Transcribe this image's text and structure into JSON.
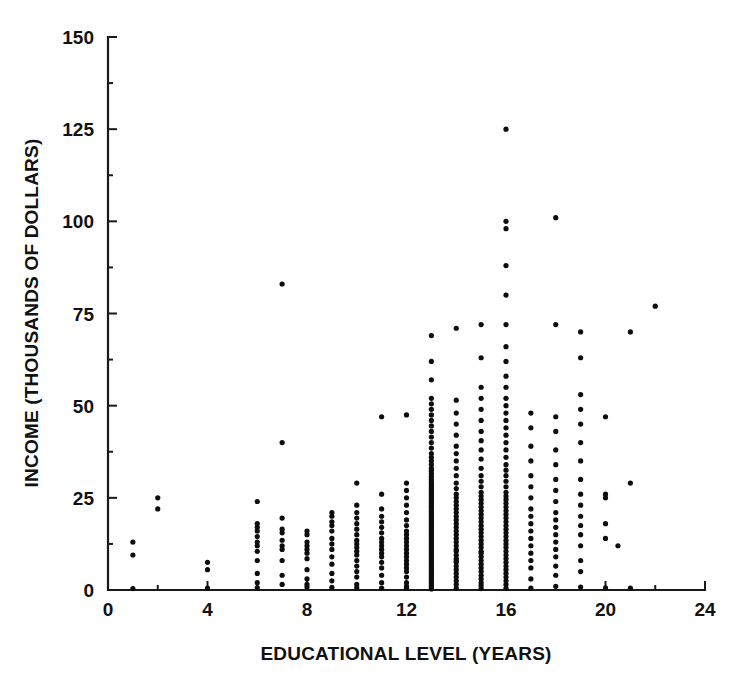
{
  "chart_data": {
    "type": "scatter",
    "title": "",
    "xlabel": "EDUCATIONAL LEVEL (YEARS)",
    "ylabel": "INCOME (THOUSANDS OF DOLLARS)",
    "xlim": [
      0,
      24
    ],
    "ylim": [
      0,
      150
    ],
    "xticks": [
      0,
      4,
      8,
      12,
      16,
      20,
      24
    ],
    "xtick_labels": [
      "0",
      "4",
      "8",
      "12",
      "16",
      "20",
      "24"
    ],
    "yticks": [
      0,
      25,
      50,
      75,
      100,
      125,
      150
    ],
    "ytick_labels": [
      "0",
      "25",
      "50",
      "75",
      "100",
      "125",
      "150"
    ],
    "x_minor_tick_interval": 2,
    "y_minor_tick_interval": 12.5,
    "grid": false,
    "legend": null,
    "marker": "filled-circle",
    "marker_color": "#0d0d0d",
    "marker_size_px": 4,
    "n_points_approx": 430,
    "points": [
      [
        1,
        0.4
      ],
      [
        1,
        9.5
      ],
      [
        1,
        13.0
      ],
      [
        2,
        22.0
      ],
      [
        2,
        25.0
      ],
      [
        4,
        0.5
      ],
      [
        4,
        5.5
      ],
      [
        4,
        7.5
      ],
      [
        6,
        0.6
      ],
      [
        6,
        2.0
      ],
      [
        6,
        4.5
      ],
      [
        6,
        8.0
      ],
      [
        6,
        10.5
      ],
      [
        6,
        12.0
      ],
      [
        6,
        13.0
      ],
      [
        6,
        14.5
      ],
      [
        6,
        16.0
      ],
      [
        6,
        17.0
      ],
      [
        6,
        18.0
      ],
      [
        6,
        24.0
      ],
      [
        7,
        1.5
      ],
      [
        7,
        4.0
      ],
      [
        7,
        8.0
      ],
      [
        7,
        11.0
      ],
      [
        7,
        12.0
      ],
      [
        7,
        13.5
      ],
      [
        7,
        15.5
      ],
      [
        7,
        16.5
      ],
      [
        7,
        19.5
      ],
      [
        7,
        40.0
      ],
      [
        7,
        83.0
      ],
      [
        8,
        0.8
      ],
      [
        8,
        1.5
      ],
      [
        8,
        3.0
      ],
      [
        8,
        5.5
      ],
      [
        8,
        8.5
      ],
      [
        8,
        10.0
      ],
      [
        8,
        11.0
      ],
      [
        8,
        12.0
      ],
      [
        8,
        13.0
      ],
      [
        8,
        15.0
      ],
      [
        8,
        16.0
      ],
      [
        9,
        0.7
      ],
      [
        9,
        2.5
      ],
      [
        9,
        4.5
      ],
      [
        9,
        7.0
      ],
      [
        9,
        9.0
      ],
      [
        9,
        11.0
      ],
      [
        9,
        12.5
      ],
      [
        9,
        14.0
      ],
      [
        9,
        16.0
      ],
      [
        9,
        17.5
      ],
      [
        9,
        18.5
      ],
      [
        9,
        20.0
      ],
      [
        9,
        21.0
      ],
      [
        10,
        0.6
      ],
      [
        10,
        1.5
      ],
      [
        10,
        3.5
      ],
      [
        10,
        5.0
      ],
      [
        10,
        6.5
      ],
      [
        10,
        8.0
      ],
      [
        10,
        9.5
      ],
      [
        10,
        10.5
      ],
      [
        10,
        11.5
      ],
      [
        10,
        12.5
      ],
      [
        10,
        13.5
      ],
      [
        10,
        15.0
      ],
      [
        10,
        16.5
      ],
      [
        10,
        18.0
      ],
      [
        10,
        19.5
      ],
      [
        10,
        21.0
      ],
      [
        10,
        23.0
      ],
      [
        10,
        29.0
      ],
      [
        11,
        0.5
      ],
      [
        11,
        2.0
      ],
      [
        11,
        4.0
      ],
      [
        11,
        6.0
      ],
      [
        11,
        7.5
      ],
      [
        11,
        9.0
      ],
      [
        11,
        10.0
      ],
      [
        11,
        11.0
      ],
      [
        11,
        12.0
      ],
      [
        11,
        13.0
      ],
      [
        11,
        14.0
      ],
      [
        11,
        15.5
      ],
      [
        11,
        17.0
      ],
      [
        11,
        18.5
      ],
      [
        11,
        20.0
      ],
      [
        11,
        22.0
      ],
      [
        11,
        26.0
      ],
      [
        11,
        47.0
      ],
      [
        12,
        0.5
      ],
      [
        12,
        1.0
      ],
      [
        12,
        2.0
      ],
      [
        12,
        3.5
      ],
      [
        12,
        5.0
      ],
      [
        12,
        6.0
      ],
      [
        12,
        7.0
      ],
      [
        12,
        8.0
      ],
      [
        12,
        9.0
      ],
      [
        12,
        10.0
      ],
      [
        12,
        11.0
      ],
      [
        12,
        12.0
      ],
      [
        12,
        13.0
      ],
      [
        12,
        14.0
      ],
      [
        12,
        15.0
      ],
      [
        12,
        16.0
      ],
      [
        12,
        17.5
      ],
      [
        12,
        19.0
      ],
      [
        12,
        21.0
      ],
      [
        12,
        23.0
      ],
      [
        12,
        25.0
      ],
      [
        12,
        27.0
      ],
      [
        12,
        29.0
      ],
      [
        12,
        47.5
      ],
      [
        13,
        0.3
      ],
      [
        13,
        0.8
      ],
      [
        13,
        1.3
      ],
      [
        13,
        1.8
      ],
      [
        13,
        2.3
      ],
      [
        13,
        2.8
      ],
      [
        13,
        3.3
      ],
      [
        13,
        3.8
      ],
      [
        13,
        4.3
      ],
      [
        13,
        4.8
      ],
      [
        13,
        5.3
      ],
      [
        13,
        5.8
      ],
      [
        13,
        6.3
      ],
      [
        13,
        6.8
      ],
      [
        13,
        7.3
      ],
      [
        13,
        7.8
      ],
      [
        13,
        8.3
      ],
      [
        13,
        8.8
      ],
      [
        13,
        9.3
      ],
      [
        13,
        9.8
      ],
      [
        13,
        10.3
      ],
      [
        13,
        10.8
      ],
      [
        13,
        11.3
      ],
      [
        13,
        11.8
      ],
      [
        13,
        12.3
      ],
      [
        13,
        12.8
      ],
      [
        13,
        13.3
      ],
      [
        13,
        13.8
      ],
      [
        13,
        14.3
      ],
      [
        13,
        14.8
      ],
      [
        13,
        15.3
      ],
      [
        13,
        15.8
      ],
      [
        13,
        16.3
      ],
      [
        13,
        16.8
      ],
      [
        13,
        17.3
      ],
      [
        13,
        17.8
      ],
      [
        13,
        18.3
      ],
      [
        13,
        18.8
      ],
      [
        13,
        19.3
      ],
      [
        13,
        19.8
      ],
      [
        13,
        20.3
      ],
      [
        13,
        20.8
      ],
      [
        13,
        21.3
      ],
      [
        13,
        21.8
      ],
      [
        13,
        22.3
      ],
      [
        13,
        22.8
      ],
      [
        13,
        23.3
      ],
      [
        13,
        23.8
      ],
      [
        13,
        24.3
      ],
      [
        13,
        24.8
      ],
      [
        13,
        25.3
      ],
      [
        13,
        25.8
      ],
      [
        13,
        26.3
      ],
      [
        13,
        26.8
      ],
      [
        13,
        27.3
      ],
      [
        13,
        27.8
      ],
      [
        13,
        28.3
      ],
      [
        13,
        28.8
      ],
      [
        13,
        29.3
      ],
      [
        13,
        30.0
      ],
      [
        13,
        30.8
      ],
      [
        13,
        31.5
      ],
      [
        13,
        32.3
      ],
      [
        13,
        33.0
      ],
      [
        13,
        34.0
      ],
      [
        13,
        35.0
      ],
      [
        13,
        36.0
      ],
      [
        13,
        37.0
      ],
      [
        13,
        38.5
      ],
      [
        13,
        40.0
      ],
      [
        13,
        41.5
      ],
      [
        13,
        43.0
      ],
      [
        13,
        44.5
      ],
      [
        13,
        46.0
      ],
      [
        13,
        47.5
      ],
      [
        13,
        49.0
      ],
      [
        13,
        50.5
      ],
      [
        13,
        52.0
      ],
      [
        13,
        57.0
      ],
      [
        13,
        62.0
      ],
      [
        13,
        69.0
      ],
      [
        14,
        0.5
      ],
      [
        14,
        1.5
      ],
      [
        14,
        2.5
      ],
      [
        14,
        3.5
      ],
      [
        14,
        4.5
      ],
      [
        14,
        5.5
      ],
      [
        14,
        6.5
      ],
      [
        14,
        7.5
      ],
      [
        14,
        8.0
      ],
      [
        14,
        8.5
      ],
      [
        14,
        9.5
      ],
      [
        14,
        10.5
      ],
      [
        14,
        11.0
      ],
      [
        14,
        12.0
      ],
      [
        14,
        13.0
      ],
      [
        14,
        14.0
      ],
      [
        14,
        15.0
      ],
      [
        14,
        16.0
      ],
      [
        14,
        17.0
      ],
      [
        14,
        18.0
      ],
      [
        14,
        19.0
      ],
      [
        14,
        20.0
      ],
      [
        14,
        21.0
      ],
      [
        14,
        22.0
      ],
      [
        14,
        23.0
      ],
      [
        14,
        24.0
      ],
      [
        14,
        25.0
      ],
      [
        14,
        26.0
      ],
      [
        14,
        27.5
      ],
      [
        14,
        29.0
      ],
      [
        14,
        31.0
      ],
      [
        14,
        33.0
      ],
      [
        14,
        35.0
      ],
      [
        14,
        37.0
      ],
      [
        14,
        39.0
      ],
      [
        14,
        42.0
      ],
      [
        14,
        45.0
      ],
      [
        14,
        48.0
      ],
      [
        14,
        51.5
      ],
      [
        14,
        71.0
      ],
      [
        15,
        0.4
      ],
      [
        15,
        1.2
      ],
      [
        15,
        2.0
      ],
      [
        15,
        3.0
      ],
      [
        15,
        4.0
      ],
      [
        15,
        5.0
      ],
      [
        15,
        6.0
      ],
      [
        15,
        7.0
      ],
      [
        15,
        8.0
      ],
      [
        15,
        9.0
      ],
      [
        15,
        10.0
      ],
      [
        15,
        10.5
      ],
      [
        15,
        11.5
      ],
      [
        15,
        12.5
      ],
      [
        15,
        13.5
      ],
      [
        15,
        14.5
      ],
      [
        15,
        15.5
      ],
      [
        15,
        16.5
      ],
      [
        15,
        17.5
      ],
      [
        15,
        18.5
      ],
      [
        15,
        19.5
      ],
      [
        15,
        20.5
      ],
      [
        15,
        21.5
      ],
      [
        15,
        22.5
      ],
      [
        15,
        23.5
      ],
      [
        15,
        24.5
      ],
      [
        15,
        25.5
      ],
      [
        15,
        26.5
      ],
      [
        15,
        28.0
      ],
      [
        15,
        29.5
      ],
      [
        15,
        31.0
      ],
      [
        15,
        33.0
      ],
      [
        15,
        35.5
      ],
      [
        15,
        38.0
      ],
      [
        15,
        40.5
      ],
      [
        15,
        43.0
      ],
      [
        15,
        46.0
      ],
      [
        15,
        49.0
      ],
      [
        15,
        52.0
      ],
      [
        15,
        55.0
      ],
      [
        15,
        63.0
      ],
      [
        15,
        72.0
      ],
      [
        16,
        0.5
      ],
      [
        16,
        1.5
      ],
      [
        16,
        2.5
      ],
      [
        16,
        3.5
      ],
      [
        16,
        4.5
      ],
      [
        16,
        5.5
      ],
      [
        16,
        6.5
      ],
      [
        16,
        7.5
      ],
      [
        16,
        8.5
      ],
      [
        16,
        9.5
      ],
      [
        16,
        10.5
      ],
      [
        16,
        11.5
      ],
      [
        16,
        12.5
      ],
      [
        16,
        13.5
      ],
      [
        16,
        14.5
      ],
      [
        16,
        15.5
      ],
      [
        16,
        16.5
      ],
      [
        16,
        17.5
      ],
      [
        16,
        18.5
      ],
      [
        16,
        19.5
      ],
      [
        16,
        20.5
      ],
      [
        16,
        21.5
      ],
      [
        16,
        22.5
      ],
      [
        16,
        23.5
      ],
      [
        16,
        24.5
      ],
      [
        16,
        25.5
      ],
      [
        16,
        26.5
      ],
      [
        16,
        28.0
      ],
      [
        16,
        29.5
      ],
      [
        16,
        31.0
      ],
      [
        16,
        32.5
      ],
      [
        16,
        34.0
      ],
      [
        16,
        36.0
      ],
      [
        16,
        38.0
      ],
      [
        16,
        40.0
      ],
      [
        16,
        42.0
      ],
      [
        16,
        44.0
      ],
      [
        16,
        46.0
      ],
      [
        16,
        48.0
      ],
      [
        16,
        50.0
      ],
      [
        16,
        52.0
      ],
      [
        16,
        55.0
      ],
      [
        16,
        58.0
      ],
      [
        16,
        62.0
      ],
      [
        16,
        66.0
      ],
      [
        16,
        72.0
      ],
      [
        16,
        80.0
      ],
      [
        16,
        88.0
      ],
      [
        16,
        98.0
      ],
      [
        16,
        100.0
      ],
      [
        16,
        125.0
      ],
      [
        17,
        0.5
      ],
      [
        17,
        3.0
      ],
      [
        17,
        6.0
      ],
      [
        17,
        8.0
      ],
      [
        17,
        10.0
      ],
      [
        17,
        12.0
      ],
      [
        17,
        14.0
      ],
      [
        17,
        16.0
      ],
      [
        17,
        18.0
      ],
      [
        17,
        20.0
      ],
      [
        17,
        22.0
      ],
      [
        17,
        25.0
      ],
      [
        17,
        28.0
      ],
      [
        17,
        31.0
      ],
      [
        17,
        35.0
      ],
      [
        17,
        39.0
      ],
      [
        17,
        44.0
      ],
      [
        17,
        48.0
      ],
      [
        18,
        1.0
      ],
      [
        18,
        4.0
      ],
      [
        18,
        6.5
      ],
      [
        18,
        9.0
      ],
      [
        18,
        11.0
      ],
      [
        18,
        13.0
      ],
      [
        18,
        15.0
      ],
      [
        18,
        17.0
      ],
      [
        18,
        19.0
      ],
      [
        18,
        21.0
      ],
      [
        18,
        24.0
      ],
      [
        18,
        27.0
      ],
      [
        18,
        30.0
      ],
      [
        18,
        34.0
      ],
      [
        18,
        38.0
      ],
      [
        18,
        43.0
      ],
      [
        18,
        47.0
      ],
      [
        18,
        72.0
      ],
      [
        18,
        101.0
      ],
      [
        19,
        0.8
      ],
      [
        19,
        5.0
      ],
      [
        19,
        8.0
      ],
      [
        19,
        12.0
      ],
      [
        19,
        15.0
      ],
      [
        19,
        17.5
      ],
      [
        19,
        20.0
      ],
      [
        19,
        23.0
      ],
      [
        19,
        26.0
      ],
      [
        19,
        30.0
      ],
      [
        19,
        35.0
      ],
      [
        19,
        40.0
      ],
      [
        19,
        45.0
      ],
      [
        19,
        49.0
      ],
      [
        19,
        53.0
      ],
      [
        19,
        63.0
      ],
      [
        19,
        70.0
      ],
      [
        20,
        0.6
      ],
      [
        20,
        14.0
      ],
      [
        20,
        18.0
      ],
      [
        20,
        25.0
      ],
      [
        20,
        26.0
      ],
      [
        20,
        47.0
      ],
      [
        20.5,
        12.0
      ],
      [
        21,
        0.5
      ],
      [
        21,
        29.0
      ],
      [
        21,
        70.0
      ],
      [
        22,
        77.0
      ]
    ]
  }
}
